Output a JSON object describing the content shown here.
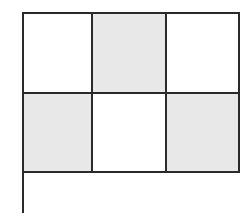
{
  "diagram": {
    "type": "grid",
    "rows": 2,
    "cols": 3,
    "cells": [
      [
        {
          "shaded": false
        },
        {
          "shaded": true
        },
        {
          "shaded": false
        }
      ],
      [
        {
          "shaded": true
        },
        {
          "shaded": false
        },
        {
          "shaded": true
        }
      ]
    ],
    "colors": {
      "line": "#2a2a2a",
      "shade": "#e8e8e8",
      "background": "#ffffff"
    },
    "has_stem": true
  }
}
